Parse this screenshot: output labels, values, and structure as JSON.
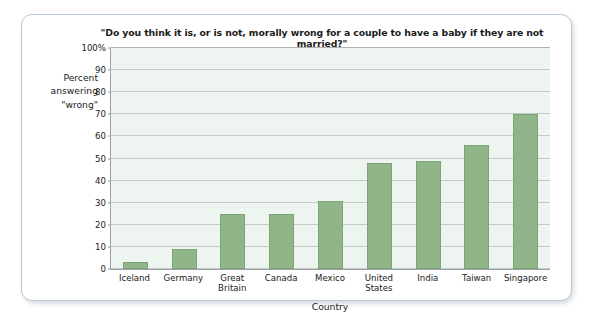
{
  "chart_data": {
    "type": "bar",
    "title": "\"Do you think it is, or is not, morally wrong for a couple to have a baby if they are not married?\"",
    "xlabel": "Country",
    "ylabel": "Percent\nanswering\n\"wrong\"",
    "ylabel_lines": [
      "Percent",
      "answering",
      "\"wrong\""
    ],
    "categories": [
      "Iceland",
      "Germany",
      "Great Britain",
      "Canada",
      "Mexico",
      "United States",
      "India",
      "Taiwan",
      "Singapore"
    ],
    "category_lines": [
      [
        "Iceland"
      ],
      [
        "Germany"
      ],
      [
        "Great",
        "Britain"
      ],
      [
        "Canada"
      ],
      [
        "Mexico"
      ],
      [
        "United",
        "States"
      ],
      [
        "India"
      ],
      [
        "Taiwan"
      ],
      [
        "Singapore"
      ]
    ],
    "values": [
      3,
      9,
      25,
      25,
      31,
      48,
      49,
      56,
      70
    ],
    "ylim": [
      0,
      100
    ],
    "ytick_values": [
      0,
      10,
      20,
      30,
      40,
      50,
      60,
      70,
      80,
      90,
      100
    ],
    "ytick_labels": [
      "0",
      "10",
      "20",
      "30",
      "40",
      "50",
      "60",
      "70",
      "80",
      "90",
      "100%"
    ],
    "grid": true,
    "legend": "none",
    "bar_color": "#8fb589",
    "bar_border_color": "#7da377",
    "plot_background": "#eef4ef",
    "gridline_color": "#c3cdc6",
    "axis_color": "#9aa0a4",
    "card_border_color": "#b9c6d6"
  }
}
